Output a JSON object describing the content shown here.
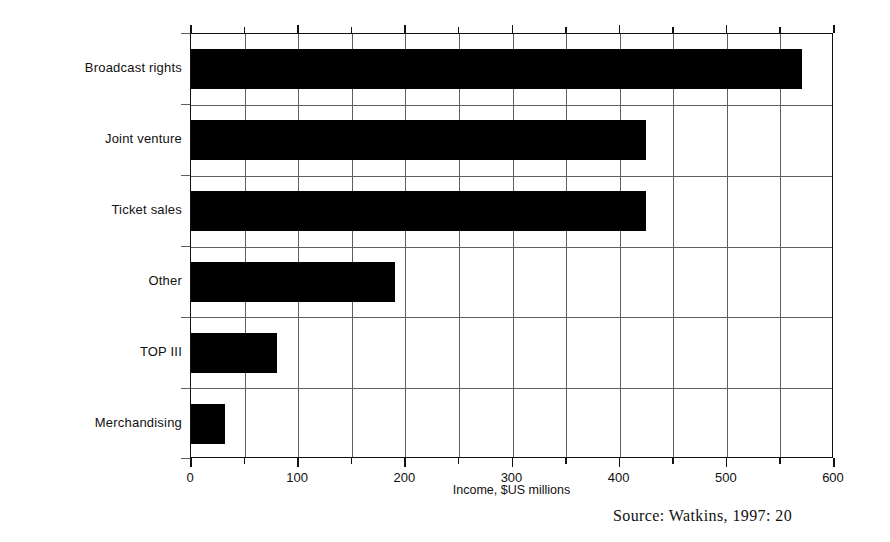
{
  "chart_data": {
    "type": "bar",
    "orientation": "horizontal",
    "title": "",
    "subtitle": "",
    "categories": [
      "Broadcast rights",
      "Joint venture",
      "Ticket sales",
      "Other",
      "TOP III",
      "Merchandising"
    ],
    "values": [
      570,
      425,
      425,
      190,
      80,
      32
    ],
    "series": [
      {
        "name": "Income",
        "values": [
          570,
          425,
          425,
          190,
          80,
          32
        ]
      }
    ],
    "xlabel": "Income, $US millions",
    "ylabel": "",
    "xlim": [
      0,
      600
    ],
    "xticks": [
      0,
      100,
      200,
      300,
      400,
      500,
      600
    ],
    "xticklabels": [
      "0",
      "100",
      "200",
      "300",
      "400",
      "500",
      "600"
    ],
    "minor_tick_step": 50,
    "grid": true,
    "grid_axis": "both",
    "legend": false,
    "legend_position": "none",
    "bar_color": "#000000",
    "grid_color": "#5f5f5f",
    "frame_color": "#111111",
    "background": "#ffffff"
  },
  "axis": {
    "x_title": "Income, $US millions",
    "tick_labels": [
      "0",
      "100",
      "200",
      "300",
      "400",
      "500",
      "600"
    ]
  },
  "categories": [
    {
      "label": "Broadcast rights",
      "value": 570
    },
    {
      "label": "Joint venture",
      "value": 425
    },
    {
      "label": "Ticket sales",
      "value": 425
    },
    {
      "label": "Other",
      "value": 190
    },
    {
      "label": "TOP III",
      "value": 80
    },
    {
      "label": "Merchandising",
      "value": 32
    }
  ],
  "footer": {
    "source": "Source:  Watkins, 1997: 20"
  }
}
